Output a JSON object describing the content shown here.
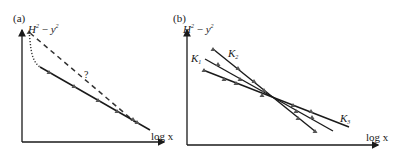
{
  "panels": [
    {
      "id": "a",
      "panel_label": "(a)",
      "y_axis_label": {
        "base1": "H",
        "sup1": "2",
        "minus": " − ",
        "base2": "y",
        "sup2": "2"
      },
      "x_axis_label": "log x",
      "annotation": "?",
      "series": [
        {
          "name": "measured",
          "style": "solid",
          "markers": "triangle"
        },
        {
          "name": "extrapolated",
          "style": "dashed"
        },
        {
          "name": "actual-low-x",
          "style": "dotted"
        }
      ]
    },
    {
      "id": "b",
      "panel_label": "(b)",
      "y_axis_label": {
        "base1": "H",
        "sup1": "2",
        "minus": " − ",
        "base2": "y",
        "sup2": "2"
      },
      "x_axis_label": "log x",
      "series_labels": [
        {
          "base": "K",
          "sub": "1"
        },
        {
          "base": "K",
          "sub": "2"
        },
        {
          "base": "K",
          "sub": "3"
        }
      ]
    }
  ],
  "colors": {
    "ink": "#1a1a1a",
    "marker": "#555555"
  }
}
